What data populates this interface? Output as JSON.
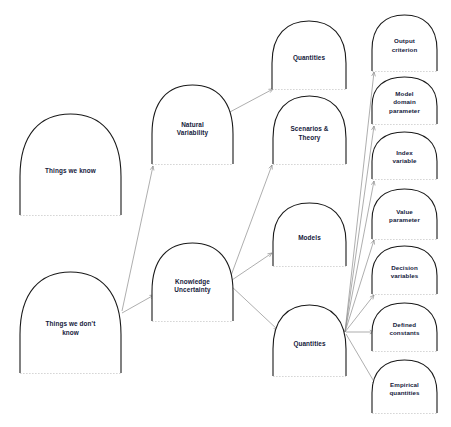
{
  "diagram": {
    "background_color": "#ffffff",
    "node_stroke_color": "#1a1a1a",
    "edge_color": "#8b8b8b",
    "label_color": "#14203a",
    "nodes": [
      {
        "id": "things-we-know",
        "label_lines": [
          "Things we know"
        ],
        "x": 20,
        "y": 114,
        "w": 101,
        "h": 101
      },
      {
        "id": "things-we-dont-know",
        "label_lines": [
          "Things we don't",
          "know"
        ],
        "x": 20,
        "y": 272,
        "w": 101,
        "h": 101
      },
      {
        "id": "natural-variability",
        "label_lines": [
          "Natural",
          "Variability"
        ],
        "x": 152,
        "y": 85,
        "w": 81,
        "h": 79
      },
      {
        "id": "knowledge-uncertainty",
        "label_lines": [
          "Knowledge",
          "Uncertainty"
        ],
        "x": 152,
        "y": 243,
        "w": 81,
        "h": 78
      },
      {
        "id": "quantities-top",
        "label_lines": [
          "Quantities"
        ],
        "x": 272,
        "y": 21,
        "w": 74,
        "h": 68
      },
      {
        "id": "scenarios-theory",
        "label_lines": [
          "Scenarios &",
          "Theory"
        ],
        "x": 273,
        "y": 96,
        "w": 73,
        "h": 68
      },
      {
        "id": "models",
        "label_lines": [
          "Models"
        ],
        "x": 273,
        "y": 203,
        "w": 73,
        "h": 63
      },
      {
        "id": "quantities-bottom",
        "label_lines": [
          "Quantities"
        ],
        "x": 273,
        "y": 305,
        "w": 73,
        "h": 71
      },
      {
        "id": "output-criterion",
        "label_lines": [
          "Output",
          "criterion"
        ],
        "x": 372,
        "y": 15,
        "w": 65,
        "h": 56
      },
      {
        "id": "model-domain-parameter",
        "label_lines": [
          "Model",
          "domain",
          "parameter"
        ],
        "x": 372,
        "y": 77,
        "w": 65,
        "h": 47
      },
      {
        "id": "index-variable",
        "label_lines": [
          "Index",
          "variable"
        ],
        "x": 372,
        "y": 132,
        "w": 65,
        "h": 47
      },
      {
        "id": "value-parameter",
        "label_lines": [
          "Value",
          "parameter"
        ],
        "x": 372,
        "y": 189,
        "w": 65,
        "h": 50
      },
      {
        "id": "decision-variables",
        "label_lines": [
          "Decision",
          "variables"
        ],
        "x": 372,
        "y": 246,
        "w": 65,
        "h": 48
      },
      {
        "id": "defined-constants",
        "label_lines": [
          "Defined",
          "constants"
        ],
        "x": 372,
        "y": 303,
        "w": 65,
        "h": 48
      },
      {
        "id": "empirical-quantities",
        "label_lines": [
          "Empirical",
          "quantities"
        ],
        "x": 372,
        "y": 360,
        "w": 65,
        "h": 53
      }
    ],
    "edges": [
      {
        "id": "dontknow-to-natural",
        "from": "things-we-dont-know",
        "to": "natural-variability",
        "x1": 122,
        "y1": 311,
        "x2": 153,
        "y2": 166
      },
      {
        "id": "dontknow-to-knowledge",
        "from": "things-we-dont-know",
        "to": "knowledge-uncertainty",
        "x1": 122,
        "y1": 313,
        "x2": 154,
        "y2": 295
      },
      {
        "id": "natural-to-quantities",
        "from": "natural-variability",
        "to": "quantities-top",
        "x1": 228,
        "y1": 113,
        "x2": 273,
        "y2": 89
      },
      {
        "id": "knowledge-to-scenarios",
        "from": "knowledge-uncertainty",
        "to": "scenarios-theory",
        "x1": 229,
        "y1": 281,
        "x2": 272,
        "y2": 165
      },
      {
        "id": "knowledge-to-models",
        "from": "knowledge-uncertainty",
        "to": "models",
        "x1": 229,
        "y1": 282,
        "x2": 272,
        "y2": 253
      },
      {
        "id": "knowledge-to-quantities",
        "from": "knowledge-uncertainty",
        "to": "quantities-bottom",
        "x1": 230,
        "y1": 285,
        "x2": 278,
        "y2": 330
      },
      {
        "id": "quantities-to-output",
        "from": "quantities-bottom",
        "to": "output-criterion",
        "x1": 345,
        "y1": 332,
        "x2": 374,
        "y2": 72
      },
      {
        "id": "quantities-to-modeldomain",
        "from": "quantities-bottom",
        "to": "model-domain-parameter",
        "x1": 345,
        "y1": 332,
        "x2": 374,
        "y2": 126
      },
      {
        "id": "quantities-to-index",
        "from": "quantities-bottom",
        "to": "index-variable",
        "x1": 345,
        "y1": 332,
        "x2": 374,
        "y2": 181
      },
      {
        "id": "quantities-to-value",
        "from": "quantities-bottom",
        "to": "value-parameter",
        "x1": 345,
        "y1": 332,
        "x2": 374,
        "y2": 240
      },
      {
        "id": "quantities-to-decision",
        "from": "quantities-bottom",
        "to": "decision-variables",
        "x1": 345,
        "y1": 332,
        "x2": 374,
        "y2": 295
      },
      {
        "id": "quantities-to-defined",
        "from": "quantities-bottom",
        "to": "defined-constants",
        "x1": 346,
        "y1": 332,
        "x2": 374,
        "y2": 332
      },
      {
        "id": "quantities-to-empirical",
        "from": "quantities-bottom",
        "to": "empirical-quantities",
        "x1": 346,
        "y1": 334,
        "x2": 376,
        "y2": 385
      }
    ]
  }
}
